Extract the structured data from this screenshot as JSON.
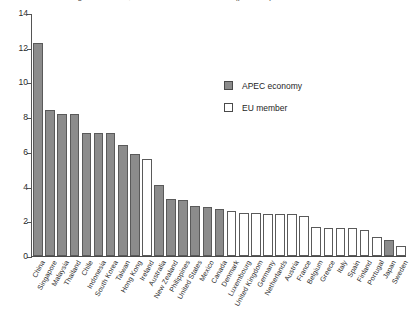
{
  "chart_data": {
    "type": "bar",
    "title": "Average tariff rates, APEC and EU economies (per cent)",
    "xlabel": "",
    "ylabel": "",
    "ylim": [
      0,
      14
    ],
    "yticks": [
      0,
      2,
      4,
      6,
      8,
      10,
      12,
      14
    ],
    "grid": false,
    "legend_position": "upper-center-right",
    "legend": [
      {
        "key": "apec",
        "label": "APEC economy",
        "color": "#8c8c8c"
      },
      {
        "key": "eu",
        "label": "EU member",
        "color": "#ffffff"
      }
    ],
    "categories": [
      "China",
      "Singapore",
      "Malaysia",
      "Thailand",
      "Chile",
      "Indonesia",
      "South Korea",
      "Taiwan",
      "Hong Kong",
      "Ireland",
      "Australia",
      "New Zealand",
      "Philippines",
      "United States",
      "Mexico",
      "Canada",
      "Denmark",
      "Luxembourg",
      "United Kingdom",
      "Germany",
      "Netherlands",
      "Austria",
      "France",
      "Belgium",
      "Greece",
      "Italy",
      "Spain",
      "Finland",
      "Portugal",
      "Japan",
      "Sweden"
    ],
    "values": [
      12.3,
      8.4,
      8.2,
      8.2,
      7.1,
      7.1,
      7.1,
      6.4,
      5.9,
      5.6,
      4.1,
      3.3,
      3.2,
      2.9,
      2.8,
      2.7,
      2.6,
      2.5,
      2.5,
      2.4,
      2.4,
      2.4,
      2.3,
      1.7,
      1.6,
      1.6,
      1.6,
      1.5,
      1.1,
      0.9,
      0.6
    ],
    "groups": [
      "apec",
      "apec",
      "apec",
      "apec",
      "apec",
      "apec",
      "apec",
      "apec",
      "apec",
      "eu",
      "apec",
      "apec",
      "apec",
      "apec",
      "apec",
      "apec",
      "eu",
      "eu",
      "eu",
      "eu",
      "eu",
      "eu",
      "eu",
      "eu",
      "eu",
      "eu",
      "eu",
      "eu",
      "eu",
      "apec",
      "eu"
    ]
  }
}
